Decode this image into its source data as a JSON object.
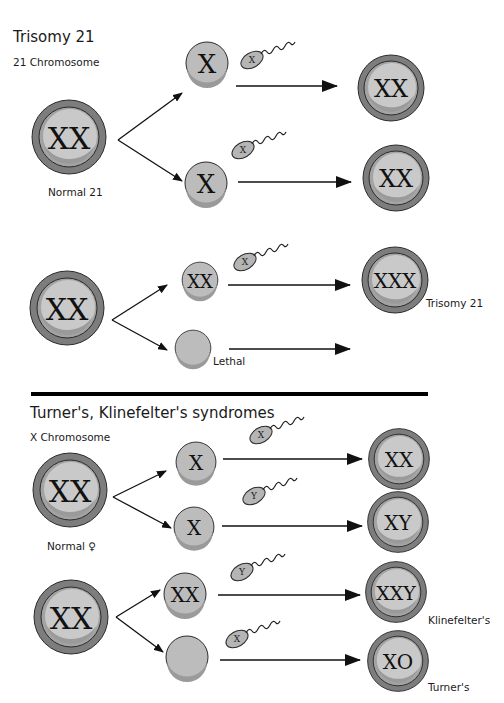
{
  "sections": [
    {
      "title": "Trisomy 21",
      "subtitle": "21 Chromosome",
      "rows": [
        {
          "parent": {
            "label": "XX",
            "caption": "Normal 21"
          },
          "gametes": [
            {
              "label": "X",
              "sperm": "X",
              "result": "XX",
              "result_caption": "",
              "gamete_caption": ""
            },
            {
              "label": "X",
              "sperm": "X",
              "result": "XX",
              "result_caption": "",
              "gamete_caption": ""
            }
          ]
        },
        {
          "parent": {
            "label": "XX",
            "caption": ""
          },
          "gametes": [
            {
              "label": "XX",
              "sperm": "X",
              "result": "XXX",
              "result_caption": "Trisomy 21",
              "gamete_caption": ""
            },
            {
              "label": "",
              "sperm": "",
              "result": "",
              "result_caption": "",
              "gamete_caption": "Lethal"
            }
          ]
        }
      ]
    },
    {
      "title": "Turner's, Klinefelter's syndromes",
      "subtitle": "X Chromosome",
      "rows": [
        {
          "parent": {
            "label": "XX",
            "caption": "Normal ♀"
          },
          "gametes": [
            {
              "label": "X",
              "sperm": "X",
              "result": "XX",
              "result_caption": ""
            },
            {
              "label": "X",
              "sperm": "Y",
              "result": "XY",
              "result_caption": ""
            }
          ]
        },
        {
          "parent": {
            "label": "XX",
            "caption": ""
          },
          "gametes": [
            {
              "label": "XX",
              "sperm": "Y",
              "result": "XXY",
              "result_caption": "Klinefelter's"
            },
            {
              "label": "",
              "sperm": "X",
              "result": "XO",
              "result_caption": "Turner's"
            }
          ]
        }
      ]
    }
  ],
  "icons": {
    "cell": "cell-circle-icon",
    "sperm": "sperm-icon",
    "arrow": "arrow-right-icon"
  },
  "colors": {
    "outer_ring": "#7d7d7d",
    "inner_ring": "#a9a9a9",
    "nucleus": "#c9c9c9",
    "shadow": "#9a9a9a",
    "stroke": "#2b2b2b",
    "divider": "#000000"
  }
}
